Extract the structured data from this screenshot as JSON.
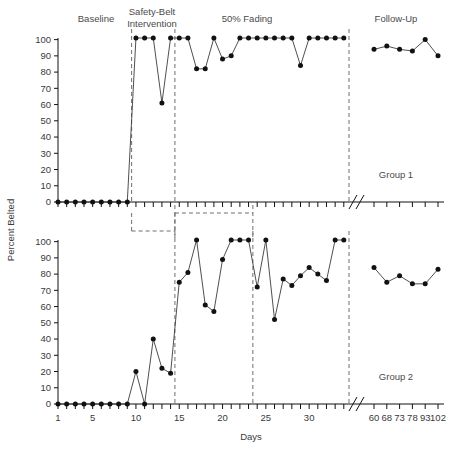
{
  "figure": {
    "ylabel": "Percent Belted",
    "xlabel": "Days",
    "panels": [
      {
        "name": "Group 1",
        "group_label": "Group 1",
        "phase_labels": [
          "Baseline",
          "Safety-Belt Intervention",
          "50% Fading",
          "Follow-Up"
        ]
      },
      {
        "name": "Group 2",
        "group_label": "Group 2",
        "phase_labels": []
      }
    ]
  },
  "axes": {
    "y_ticks": [
      0,
      10,
      20,
      30,
      40,
      50,
      60,
      70,
      80,
      90,
      100
    ],
    "y_tick_labels": [
      "0",
      "10",
      "20",
      "30",
      "40",
      "50",
      "60",
      "70",
      "80",
      "90",
      "100"
    ],
    "ylim": [
      0,
      100
    ],
    "x_major_labels": [
      "1",
      "5",
      "10",
      "15",
      "20",
      "25",
      "30"
    ],
    "x_major_values": [
      1,
      5,
      10,
      15,
      20,
      25,
      30
    ],
    "x_followup_labels": [
      "60",
      "68",
      "73",
      "78",
      "93",
      "102"
    ],
    "x_followup_values": [
      60,
      68,
      73,
      78,
      93,
      102
    ],
    "xlim_main": [
      1,
      34
    ],
    "axis_break": true,
    "grid": false
  },
  "chart_data": {
    "type": "line",
    "title": "",
    "xlabel": "Days",
    "ylabel": "Percent Belted",
    "ylim": [
      0,
      100
    ],
    "series": [
      {
        "name": "Group 1",
        "panel": "top",
        "segments": [
          {
            "phase": "Baseline",
            "x": [
              1,
              2,
              3,
              4,
              5,
              6,
              7,
              8,
              9
            ],
            "values": [
              0,
              0,
              0,
              0,
              0,
              0,
              0,
              0,
              0
            ]
          },
          {
            "phase": "Safety-Belt Intervention",
            "x": [
              10,
              11,
              12,
              13,
              14
            ],
            "values": [
              101,
              101,
              101,
              61,
              101
            ]
          },
          {
            "phase": "50% Fading",
            "x": [
              15,
              16,
              17,
              18,
              19,
              20,
              21,
              22,
              23,
              24,
              25,
              26,
              27,
              28,
              29,
              30,
              31,
              32,
              33,
              34
            ],
            "values": [
              101,
              101,
              82,
              82,
              101,
              88,
              90,
              101,
              101,
              101,
              101,
              101,
              101,
              101,
              84,
              101,
              101,
              101,
              101,
              101
            ]
          },
          {
            "phase": "Follow-Up",
            "x": [
              60,
              68,
              73,
              78,
              93,
              102
            ],
            "values": [
              94,
              96,
              94,
              93,
              100,
              90
            ]
          }
        ]
      },
      {
        "name": "Group 2",
        "panel": "bottom",
        "segments": [
          {
            "phase": "Baseline",
            "x": [
              1,
              2,
              3,
              4,
              5,
              6,
              7,
              8,
              9,
              10,
              11,
              12,
              13,
              14
            ],
            "values": [
              0,
              0,
              0,
              0,
              0,
              0,
              0,
              0,
              0,
              20,
              0,
              40,
              22,
              19
            ]
          },
          {
            "phase": "Safety-Belt Intervention",
            "x": [
              15,
              16,
              17,
              18,
              19,
              20,
              21,
              22,
              23
            ],
            "values": [
              75,
              81,
              101,
              61,
              57,
              89,
              101,
              101,
              101
            ]
          },
          {
            "phase": "50% Fading",
            "x": [
              24,
              25,
              26,
              27,
              28,
              29,
              30,
              31,
              32,
              33,
              34
            ],
            "values": [
              72,
              101,
              52,
              77,
              73,
              79,
              84,
              80,
              76,
              101,
              101
            ]
          },
          {
            "phase": "Follow-Up",
            "x": [
              60,
              68,
              73,
              78,
              93,
              102
            ],
            "values": [
              84,
              75,
              79,
              74,
              74,
              83
            ]
          }
        ]
      }
    ],
    "phase_dividers": {
      "top": [
        9.5,
        14.5,
        34.6
      ],
      "bottom": [
        14.5,
        23.5,
        34.6
      ]
    }
  }
}
